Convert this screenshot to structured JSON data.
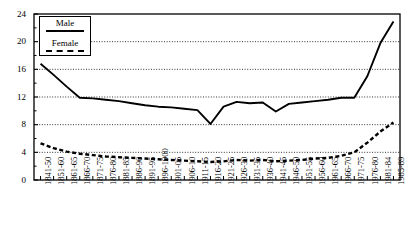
{
  "chart_data": {
    "type": "line",
    "title": "",
    "xlabel": "",
    "ylabel": "",
    "ylim": [
      0,
      24
    ],
    "yticks": [
      0,
      4,
      8,
      12,
      16,
      20,
      24
    ],
    "grid": "horizontal-dotted",
    "legend_position": "top-left",
    "categories": [
      "1841-50",
      "1851-60",
      "1861-65",
      "1866-70",
      "1871-75",
      "1876-80",
      "1881-85",
      "1886-90",
      "1891-95",
      "1896-1900",
      "1901-05",
      "1906-10",
      "1911-15",
      "1916-20",
      "1921-25",
      "1926-30",
      "1931-35",
      "1936-40",
      "1941-45",
      "1946-50",
      "1951-55",
      "1956-60",
      "1961-65",
      "1966-70",
      "1971-75",
      "1976-80",
      "1981-84",
      "1985-89"
    ],
    "series": [
      {
        "name": "Male",
        "style": "solid",
        "color": "#000000",
        "values": [
          16.8,
          15.2,
          13.5,
          11.9,
          11.8,
          11.6,
          11.4,
          11.1,
          10.8,
          10.6,
          10.5,
          10.3,
          10.1,
          8.1,
          10.6,
          11.3,
          11.1,
          11.2,
          9.9,
          11.0,
          11.2,
          11.4,
          11.6,
          11.9,
          11.9,
          15.0,
          19.8,
          22.9
        ]
      },
      {
        "name": "Female",
        "style": "dashed",
        "color": "#000000",
        "values": [
          5.3,
          4.6,
          4.1,
          3.8,
          3.6,
          3.4,
          3.3,
          3.2,
          3.1,
          3.0,
          2.9,
          2.8,
          2.7,
          2.6,
          2.7,
          2.9,
          2.8,
          2.9,
          2.7,
          2.8,
          2.9,
          3.1,
          3.2,
          3.5,
          4.0,
          5.4,
          7.0,
          8.3
        ]
      }
    ]
  },
  "legend": {
    "male_label": "Male",
    "female_label": "Female"
  }
}
